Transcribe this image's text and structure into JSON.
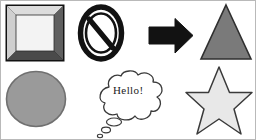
{
  "canvas": {
    "width": 256,
    "height": 140,
    "background": "#ffffff",
    "border_color": "#b9b9b9",
    "title": "Clipart shapes sheet"
  },
  "palette": {
    "black": "#121212",
    "outline_dark": "#3a3a3a",
    "triangle_fill": "#7a7a7a",
    "ellipse_fill": "#9a9a9a",
    "star_fill": "#e8e8e8",
    "square_face": "#f2f2f2",
    "bevel_light": "#dcdcdc",
    "bevel_dark": "#6a6a6a",
    "bevel_darkest": "#4a4a4a",
    "bubble_fill": "#ffffff",
    "text_color": "#1b1b1b"
  },
  "shapes": [
    {
      "id": "beveled-square",
      "name": "beveled-square",
      "label": "Beveled 3D square frame",
      "row": 1,
      "column": 1,
      "fill": "#f2f2f2",
      "outline": "#121212"
    },
    {
      "id": "prohibition-sign",
      "name": "prohibition-sign",
      "label": "No entry / prohibition sign",
      "row": 1,
      "column": 2,
      "fill": "#ffffff",
      "outline": "#121212"
    },
    {
      "id": "arrow-right",
      "name": "right-arrow",
      "label": "Solid black right arrow",
      "row": 1,
      "column": 3,
      "fill": "#121212",
      "outline": "#121212"
    },
    {
      "id": "triangle",
      "name": "triangle",
      "label": "Gray triangle",
      "row": 1,
      "column": 4,
      "fill": "#7a7a7a",
      "outline": "#3a3a3a"
    },
    {
      "id": "ellipse",
      "name": "ellipse",
      "label": "Gray ellipse",
      "row": 2,
      "column": 1,
      "fill": "#9a9a9a",
      "outline": "#6a6a6a"
    },
    {
      "id": "thought-bubble",
      "name": "thought-bubble",
      "label": "Thought bubble with greeting",
      "row": 2,
      "column": 2,
      "fill": "#ffffff",
      "outline": "#3a3a3a",
      "text": "Hello!"
    },
    {
      "id": "star",
      "name": "five-pointed-star",
      "label": "Five pointed star",
      "row": 2,
      "column": 3,
      "fill": "#e8e8e8",
      "outline": "#3a3a3a"
    }
  ],
  "bubble": {
    "text": "Hello!"
  }
}
